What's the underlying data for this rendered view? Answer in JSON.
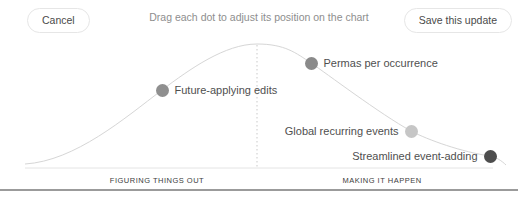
{
  "header": {
    "cancel_label": "Cancel",
    "instruction": "Drag each dot to adjust its position on the chart",
    "save_label": "Save this update"
  },
  "chart_data": {
    "type": "scatter",
    "title": "",
    "curve_shape": "bell",
    "grid": false,
    "x_axis_sections": [
      "FIGURING THINGS OUT",
      "MAKING IT HAPPEN"
    ],
    "divider_line_color": "#9b9b9b",
    "curve_color": "#d6d6d6",
    "points": [
      {
        "label": "Future-applying edits",
        "x": 162,
        "y": 90,
        "color": "#8f8f8f",
        "side": "right"
      },
      {
        "label": "Permas per occurrence",
        "x": 311,
        "y": 63,
        "color": "#8a8a8a",
        "side": "right"
      },
      {
        "label": "Global recurring events",
        "x": 411,
        "y": 131,
        "color": "#c6c6c6",
        "side": "left"
      },
      {
        "label": "Streamlined event-adding",
        "x": 490,
        "y": 156,
        "color": "#4d4d4d",
        "side": "left"
      }
    ]
  }
}
